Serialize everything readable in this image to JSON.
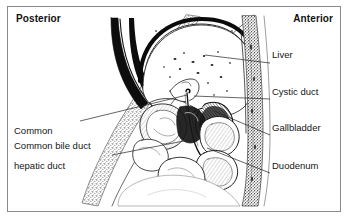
{
  "figure": {
    "border_color": "#8a8a8a",
    "background": "#ffffff",
    "ink_color": "#151515"
  },
  "orientation": {
    "posterior": "Posterior",
    "anterior": "Anterior"
  },
  "annotations": {
    "right": [
      {
        "id": "liver",
        "label": "Liver"
      },
      {
        "id": "cystic_duct",
        "label": "Cystic duct"
      },
      {
        "id": "gallbladder",
        "label": "Gallbladder"
      },
      {
        "id": "duodenum",
        "label": "Duodenum"
      }
    ],
    "left": [
      {
        "id": "common_hepatic_duct",
        "line1": "Common",
        "line2": "hepatic duct"
      },
      {
        "id": "common_bile_duct",
        "label": "Common bile duct"
      }
    ]
  }
}
